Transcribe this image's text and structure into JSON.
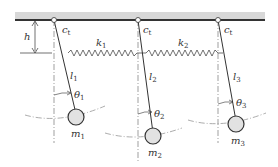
{
  "diagram": {
    "colors": {
      "line": "#333333",
      "ceiling": "#d8d8d8",
      "mass_fill": "#e2e2e2",
      "dash": "#777777"
    },
    "labels": {
      "h": "h",
      "c1": "c",
      "c1_sub": "t",
      "c2": "c",
      "c2_sub": "t",
      "c3": "c",
      "c3_sub": "t",
      "k1": "k",
      "k1_sub": "1",
      "k2": "k",
      "k2_sub": "2",
      "l1": "l",
      "l1_sub": "1",
      "l2": "l",
      "l2_sub": "2",
      "l3": "l",
      "l3_sub": "3",
      "theta1": "θ",
      "theta1_sub": "1",
      "theta2": "θ",
      "theta2_sub": "2",
      "theta3": "θ",
      "theta3_sub": "3",
      "m1": "m",
      "m1_sub": "1",
      "m2": "m",
      "m2_sub": "2",
      "m3": "m",
      "m3_sub": "3"
    }
  }
}
